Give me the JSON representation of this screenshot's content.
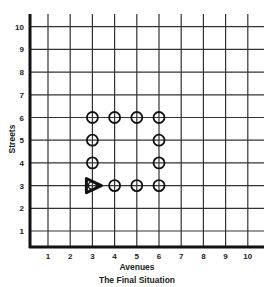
{
  "title": "The Final Situation",
  "x_axis": {
    "label": "Avenues",
    "ticks": [
      "1",
      "2",
      "3",
      "4",
      "5",
      "6",
      "7",
      "8",
      "9",
      "10"
    ]
  },
  "y_axis": {
    "label": "Streets",
    "ticks": [
      "1",
      "2",
      "3",
      "4",
      "5",
      "6",
      "7",
      "8",
      "9",
      "10"
    ]
  },
  "markers": {
    "circles": [
      {
        "avenue": 3,
        "street": 6
      },
      {
        "avenue": 4,
        "street": 6
      },
      {
        "avenue": 5,
        "street": 6
      },
      {
        "avenue": 6,
        "street": 6
      },
      {
        "avenue": 3,
        "street": 5
      },
      {
        "avenue": 6,
        "street": 5
      },
      {
        "avenue": 3,
        "street": 4
      },
      {
        "avenue": 6,
        "street": 4
      },
      {
        "avenue": 4,
        "street": 3
      },
      {
        "avenue": 5,
        "street": 3
      },
      {
        "avenue": 6,
        "street": 3
      }
    ],
    "robot": {
      "avenue": 3,
      "street": 3,
      "facing": "east",
      "has_circle": true
    }
  },
  "colors": {
    "line": "#222222",
    "background": "#ffffff"
  }
}
